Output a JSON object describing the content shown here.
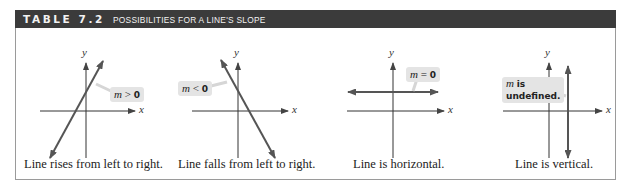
{
  "header": {
    "table_number": "TABLE 7.2",
    "title": "POSSIBILITIES FOR A LINE'S SLOPE"
  },
  "panels": [
    {
      "axis_x": "x",
      "axis_y": "y",
      "slope_var": "m",
      "slope_rel": " > ",
      "slope_val": "0",
      "caption": "Line rises from left to right."
    },
    {
      "axis_x": "x",
      "axis_y": "y",
      "slope_var": "m",
      "slope_rel": " < ",
      "slope_val": "0",
      "caption": "Line falls from left to right."
    },
    {
      "axis_x": "x",
      "axis_y": "y",
      "slope_var": "m",
      "slope_rel": " = ",
      "slope_val": "0",
      "caption": "Line is horizontal."
    },
    {
      "axis_x": "x",
      "axis_y": "y",
      "slope_var": "m",
      "slope_rel": " ",
      "slope_val": "is",
      "slope_val2": "undefined.",
      "caption": "Line is vertical."
    }
  ],
  "colors": {
    "header_bg": "#3b3b3b",
    "line_color": "#555555",
    "label_bg": "#e4e4e4",
    "border": "#9a9a9a"
  }
}
